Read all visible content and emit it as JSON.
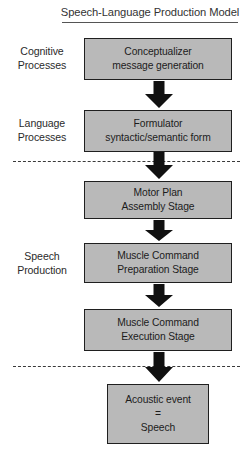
{
  "diagram": {
    "title": "Speech-Language Production Model",
    "colors": {
      "box_fill": "#b9b9b9",
      "box_border": "#1f1f1f",
      "arrow": "#111111",
      "text": "#1c1c1c",
      "separator": "#3a3a3a",
      "background": "#ffffff"
    },
    "side_labels": [
      {
        "line1": "Cognitive",
        "line2": "Processes"
      },
      {
        "line1": "Language",
        "line2": "Processes"
      },
      {
        "line1": "Speech",
        "line2": "Production"
      }
    ],
    "stages": [
      {
        "line1": "Conceptualizer",
        "line2": "message generation"
      },
      {
        "line1": "Formulator",
        "line2": "syntactic/semantic form"
      },
      {
        "line1": "Motor Plan",
        "line2": "Assembly Stage"
      },
      {
        "line1": "Muscle Command",
        "line2": "Preparation Stage"
      },
      {
        "line1": "Muscle Command",
        "line2": "Execution Stage"
      },
      {
        "line1": "Acoustic event",
        "line2": "=",
        "line3": "Speech"
      }
    ],
    "arrows": [
      {
        "name": "arrow-conceptualizer-to-formulator"
      },
      {
        "name": "arrow-formulator-to-motor-plan"
      },
      {
        "name": "arrow-motor-plan-to-muscle-preparation"
      },
      {
        "name": "arrow-muscle-preparation-to-muscle-execution"
      },
      {
        "name": "arrow-muscle-execution-to-acoustic-event"
      }
    ],
    "separators": [
      {
        "name": "dashed-separator-language-motor"
      },
      {
        "name": "dashed-separator-execution-acoustic"
      }
    ]
  }
}
